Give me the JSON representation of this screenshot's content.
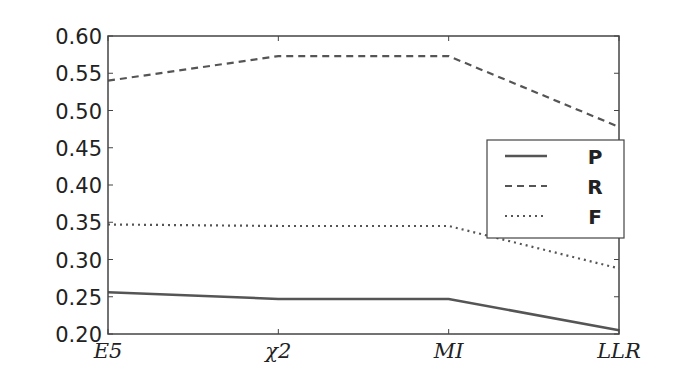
{
  "chart_data": {
    "type": "line",
    "title": "",
    "xlabel": "",
    "ylabel": "",
    "categories": [
      "E5",
      "χ2",
      "MI",
      "LLR"
    ],
    "ylim": [
      0.2,
      0.6
    ],
    "yticks": [
      "0.20",
      "0.25",
      "0.30",
      "0.35",
      "0.40",
      "0.45",
      "0.50",
      "0.55",
      "0.60"
    ],
    "grid": false,
    "legend_position": "center right",
    "series": [
      {
        "name": "P",
        "style": "solid",
        "values": [
          0.256,
          0.247,
          0.247,
          0.205
        ]
      },
      {
        "name": "R",
        "style": "dashed",
        "values": [
          0.54,
          0.573,
          0.573,
          0.478
        ]
      },
      {
        "name": "F",
        "style": "dotted",
        "values": [
          0.347,
          0.345,
          0.345,
          0.288
        ]
      }
    ],
    "line_color": "#555555"
  }
}
